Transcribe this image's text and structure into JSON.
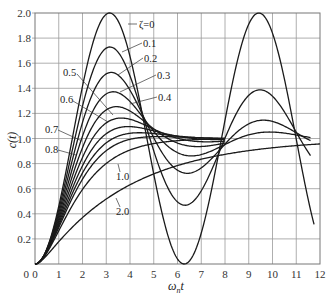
{
  "chart_data": {
    "type": "line",
    "title": "",
    "xlabel": "ω_n t",
    "ylabel": "c(t)",
    "xlim": [
      0,
      12
    ],
    "ylim": [
      0,
      2.0
    ],
    "grid": true,
    "legend_position": "inline labels with leader lines",
    "x_ticks": [
      "0",
      "1",
      "2",
      "3",
      "4",
      "5",
      "6",
      "7",
      "8",
      "9",
      "10",
      "11",
      "12"
    ],
    "y_ticks": [
      "0",
      "0.2",
      "0.4",
      "0.6",
      "0.8",
      "1.0",
      "1.2",
      "1.4",
      "1.6",
      "1.8",
      "2.0"
    ],
    "x": [
      0,
      1,
      2,
      3,
      4,
      5,
      6,
      7,
      8,
      9,
      10,
      11,
      12
    ],
    "series": [
      {
        "name": "ζ=0",
        "zeta": 0,
        "t_max": 11.75,
        "values": [
          0,
          0.46,
          1.42,
          1.99,
          1.65,
          0.72,
          0.04,
          0.25,
          1.15,
          1.91,
          1.84,
          0.99,
          null
        ]
      },
      {
        "name": "0.1",
        "zeta": 0.1,
        "t_max": 11.6,
        "values": [
          0,
          0.43,
          1.26,
          1.72,
          1.5,
          0.9,
          0.5,
          0.58,
          1.0,
          1.35,
          1.34,
          1.03,
          null
        ]
      },
      {
        "name": "0.2",
        "zeta": 0.2,
        "t_max": 11.6,
        "values": [
          0,
          0.41,
          1.13,
          1.51,
          1.37,
          0.99,
          0.75,
          0.8,
          1.04,
          1.18,
          1.13,
          1.0,
          null
        ]
      },
      {
        "name": "0.3",
        "zeta": 0.3,
        "t_max": 11.6,
        "values": [
          0,
          0.39,
          1.03,
          1.35,
          1.26,
          1.03,
          0.88,
          0.91,
          1.02,
          1.07,
          1.04,
          1.0,
          null
        ]
      },
      {
        "name": "0.4",
        "zeta": 0.4,
        "t_max": 8.0,
        "values": [
          0,
          0.37,
          0.95,
          1.22,
          1.18,
          1.04,
          0.95,
          0.96,
          1.0,
          null,
          null,
          null,
          null
        ]
      },
      {
        "name": "0.5",
        "zeta": 0.5,
        "t_max": 8.0,
        "values": [
          0,
          0.34,
          0.87,
          1.12,
          1.12,
          1.04,
          0.99,
          0.99,
          1.0,
          null,
          null,
          null,
          null
        ]
      },
      {
        "name": "0.6",
        "zeta": 0.6,
        "t_max": 8.0,
        "values": [
          0,
          0.32,
          0.8,
          1.04,
          1.08,
          1.04,
          1.01,
          1.0,
          1.0,
          null,
          null,
          null,
          null
        ]
      },
      {
        "name": "0.7",
        "zeta": 0.7,
        "t_max": 8.0,
        "values": [
          0,
          0.3,
          0.74,
          0.98,
          1.04,
          1.03,
          1.01,
          1.0,
          1.0,
          null,
          null,
          null,
          null
        ]
      },
      {
        "name": "0.8",
        "zeta": 0.8,
        "t_max": 8.0,
        "values": [
          0,
          0.28,
          0.68,
          0.92,
          1.01,
          1.02,
          1.01,
          1.0,
          1.0,
          null,
          null,
          null,
          null
        ]
      },
      {
        "name": "1.0",
        "zeta": 1.0,
        "t_max": 8.0,
        "values": [
          0,
          0.26,
          0.59,
          0.8,
          0.91,
          0.96,
          0.98,
          0.99,
          1.0,
          null,
          null,
          null,
          null
        ]
      },
      {
        "name": "2.0",
        "zeta": 2.0,
        "t_max": 12.0,
        "values": [
          0,
          0.18,
          0.37,
          0.52,
          0.63,
          0.72,
          0.79,
          0.84,
          0.88,
          0.91,
          0.93,
          0.95,
          0.96
        ]
      }
    ],
    "annotations": [
      {
        "text": "ζ=0",
        "x": 139,
        "y": 28,
        "lx1": 137,
        "ly1": 24,
        "lx2": 128,
        "ly2": 24
      },
      {
        "text": "0.1",
        "x": 143,
        "y": 47,
        "lx1": 142,
        "ly1": 43,
        "lx2": 122,
        "ly2": 52
      },
      {
        "text": "0.2",
        "x": 144,
        "y": 62,
        "lx1": 143,
        "ly1": 58,
        "lx2": 118,
        "ly2": 75
      },
      {
        "text": "0.3",
        "x": 157,
        "y": 79,
        "lx1": 156,
        "ly1": 75,
        "lx2": 120,
        "ly2": 92
      },
      {
        "text": "0.4",
        "x": 158,
        "y": 101,
        "lx1": 157,
        "ly1": 97,
        "lx2": 130,
        "ly2": 104
      },
      {
        "text": "0.5",
        "x": 63,
        "y": 76,
        "lx1": 77,
        "ly1": 74,
        "lx2": 113,
        "ly2": 115
      },
      {
        "text": "0.6",
        "x": 60,
        "y": 103,
        "lx1": 73,
        "ly1": 101,
        "lx2": 108,
        "ly2": 122
      },
      {
        "text": "0.7",
        "x": 45,
        "y": 133,
        "lx1": 58,
        "ly1": 130,
        "lx2": 82,
        "ly2": 141
      },
      {
        "text": "0.8",
        "x": 45,
        "y": 153,
        "lx1": 58,
        "ly1": 150,
        "lx2": 76,
        "ly2": 155
      },
      {
        "text": "1.0",
        "x": 116,
        "y": 180,
        "lx1": 120,
        "ly1": 172,
        "lx2": 118,
        "ly2": 164
      },
      {
        "text": "2.0",
        "x": 116,
        "y": 215,
        "lx1": 120,
        "ly1": 207,
        "lx2": 116,
        "ly2": 198
      }
    ]
  },
  "axes": {
    "x_title_main": "ω",
    "x_title_sub": "n",
    "x_title_tail": "t",
    "y_title": "c(t)"
  }
}
